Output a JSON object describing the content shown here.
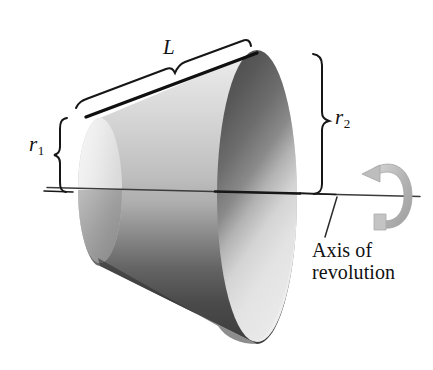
{
  "figure": {
    "type": "geometry-diagram",
    "shape": "frustum-of-cone",
    "background_color": "#ffffff",
    "width": 433,
    "height": 370
  },
  "labels": {
    "slant_height": "L",
    "small_radius_symbol": "r",
    "small_radius_sub": "1",
    "large_radius_symbol": "r",
    "large_radius_sub": "2",
    "axis_line1": "Axis of",
    "axis_line2": "revolution"
  },
  "icons": {
    "rotation_arrow": "rotation-arrow-icon",
    "brace_slant": "brace-icon",
    "brace_left": "brace-icon",
    "brace_right": "brace-icon",
    "leader": "leader-line-icon"
  },
  "geometry": {
    "axis_line": {
      "x1": 47,
      "y1": 187,
      "x2": 420,
      "y2": 196
    },
    "small_end_center": {
      "x": 100,
      "y": 190
    },
    "small_end_radius_x": 22,
    "small_end_radius_y": 72,
    "large_end_center": {
      "x": 257,
      "y": 196
    },
    "large_end_radius_x": 40,
    "large_end_radius_y": 148,
    "slant_segment": {
      "x1": 86,
      "y1": 116,
      "x2": 256,
      "y2": 53
    },
    "brace_L": {
      "x1": 78,
      "y1": 103,
      "x2": 248,
      "y2": 40
    },
    "brace_r1": {
      "x": 60,
      "y_top": 118,
      "y_bottom": 192
    },
    "brace_r2": {
      "x": 322,
      "y_top": 53,
      "y_bottom": 192
    },
    "leader_line": {
      "x1": 336,
      "y1": 196,
      "x2": 325,
      "y2": 236
    },
    "rotation_arrow_center": {
      "x": 388,
      "y": 196
    }
  },
  "colors": {
    "ink": "#111111",
    "surface_light": "#f2f2f2",
    "surface_mid": "#c9c9c9",
    "surface_dark": "#3a3a3a",
    "interior_dark": "#555555",
    "interior_light": "#e4e4e4",
    "arrow_gray": "#b8b8b8",
    "axis_gray": "#4a4a4a"
  }
}
